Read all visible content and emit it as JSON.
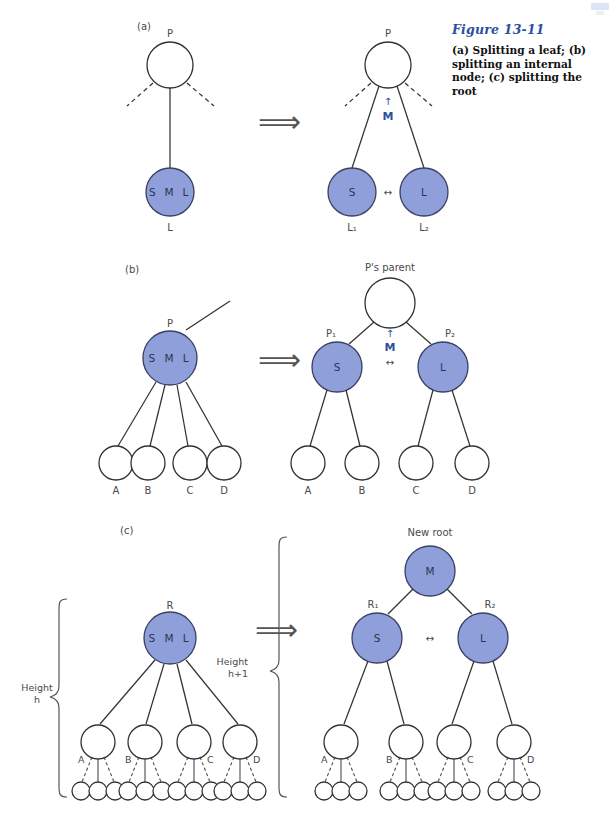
{
  "figure": {
    "number": "Figure 13-11",
    "caption": "(a) Splitting a leaf; (b) splitting an internal node; (c) splitting the root"
  },
  "style": {
    "node_fill_blue": "#8e9fd9",
    "node_fill_white": "#ffffff",
    "node_stroke": "#333333",
    "text_gray": "#4a4a4a",
    "accent_blue": "#2b4f9e",
    "arrow_gray": "#555555",
    "page_bg": "#ffffff"
  },
  "panels": [
    {
      "id": "a",
      "label": "(a)",
      "transform_arrow": "⟹",
      "before": {
        "nodes": [
          {
            "id": "a-P",
            "label": "P",
            "inside": "",
            "fill": "white",
            "caption_pos": "top"
          },
          {
            "id": "a-L",
            "label": "L",
            "inside": "S M L",
            "fill": "blue",
            "caption_pos": "bottom"
          }
        ]
      },
      "after": {
        "promoted_key": "M",
        "promote_arrow": "↑",
        "sibling_arrow": "↔",
        "nodes": [
          {
            "id": "a2-P",
            "label": "P",
            "inside": "",
            "fill": "white",
            "caption_pos": "top"
          },
          {
            "id": "a2-L1",
            "label": "L₁",
            "inside": "S",
            "fill": "blue",
            "caption_pos": "bottom"
          },
          {
            "id": "a2-L2",
            "label": "L₂",
            "inside": "L",
            "fill": "blue",
            "caption_pos": "bottom"
          }
        ]
      }
    },
    {
      "id": "b",
      "label": "(b)",
      "transform_arrow": "⟹",
      "before": {
        "nodes": [
          {
            "id": "b-P",
            "label": "P",
            "inside": "S M L",
            "fill": "blue",
            "caption_pos": "top"
          }
        ],
        "children": [
          "A",
          "B",
          "C",
          "D"
        ]
      },
      "after": {
        "parent_label": "P's parent",
        "promoted_key": "M",
        "promote_arrow": "↑",
        "sibling_arrow": "↔",
        "nodes": [
          {
            "id": "b2-PP",
            "label": "",
            "inside": "",
            "fill": "white",
            "caption_pos": "top"
          },
          {
            "id": "b2-P1",
            "label": "P₁",
            "inside": "S",
            "fill": "blue",
            "caption_pos": "top"
          },
          {
            "id": "b2-P2",
            "label": "P₂",
            "inside": "L",
            "fill": "blue",
            "caption_pos": "top"
          }
        ],
        "children": [
          "A",
          "B",
          "C",
          "D"
        ]
      }
    },
    {
      "id": "c",
      "label": "(c)",
      "transform_arrow": "⟹",
      "before": {
        "height_label_line1": "Height",
        "height_label_line2": "h",
        "nodes": [
          {
            "id": "c-R",
            "label": "R",
            "inside": "S M L",
            "fill": "blue",
            "caption_pos": "top"
          }
        ],
        "children": [
          "A",
          "B",
          "C",
          "D"
        ],
        "grandchildren_per_child": 3
      },
      "after": {
        "height_label_line1": "Height",
        "height_label_line2": "h+1",
        "new_root_label": "New root",
        "sibling_arrow": "↔",
        "nodes": [
          {
            "id": "c2-M",
            "label": "",
            "inside": "M",
            "fill": "blue",
            "caption_pos": "top"
          },
          {
            "id": "c2-R1",
            "label": "R₁",
            "inside": "S",
            "fill": "blue",
            "caption_pos": "top"
          },
          {
            "id": "c2-R2",
            "label": "R₂",
            "inside": "L",
            "fill": "blue",
            "caption_pos": "top"
          }
        ],
        "children": [
          "A",
          "B",
          "C",
          "D"
        ],
        "grandchildren_per_child": 3
      }
    }
  ]
}
